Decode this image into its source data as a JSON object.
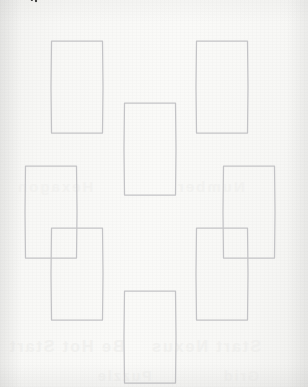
{
  "page": {
    "width": 308,
    "height": 387,
    "background_color": "#f7f7f5",
    "medium": "scanned paper"
  },
  "colors": {
    "paper": "#f7f7f5",
    "hex_stroke": "#c3c3c6",
    "arc_dots": "#2e2e2e",
    "ghost_text": "#ececea"
  },
  "arc": {
    "name": "dotted-arc",
    "style": "dotted",
    "shape": "concave-down circular arc (lower edge of a large circle)",
    "dot_color": "#2e2e2e",
    "dot_radius": 1.15,
    "dot_count": 76,
    "left_end": {
      "x": 36,
      "y": 1
    },
    "apex": {
      "x": 150,
      "y": 17
    },
    "right_end": {
      "x": 268,
      "y": 1
    },
    "label": ""
  },
  "hex_grid": {
    "name": "hexagon-honeycomb",
    "orientation": "flat-top",
    "count": 7,
    "stroke_color": "#c3c3c6",
    "stroke_width": 1.25,
    "fill": "none",
    "half_width": 26,
    "half_height": 46,
    "top_edge_half": 25.5,
    "arrangement": "2-3-2 flower cluster",
    "cells": [
      {
        "id": "hex-top-left",
        "label": "",
        "cx": 77,
        "cy": 87
      },
      {
        "id": "hex-top-right",
        "label": "",
        "cx": 222,
        "cy": 87
      },
      {
        "id": "hex-mid-left",
        "label": "",
        "cx": 51,
        "cy": 212
      },
      {
        "id": "hex-mid-center",
        "label": "",
        "cx": 150,
        "cy": 149
      },
      {
        "id": "hex-mid-right",
        "label": "",
        "cx": 249,
        "cy": 212
      },
      {
        "id": "hex-bottom-left",
        "label": "",
        "cx": 77,
        "cy": 274
      },
      {
        "id": "hex-bottom-right",
        "label": "",
        "cx": 222,
        "cy": 274
      },
      {
        "id": "hex-bottom-center",
        "label": "",
        "cx": 150,
        "cy": 337
      }
    ]
  },
  "ghost_marks": [
    {
      "text": "Be Hot Start",
      "x": 8,
      "y": 338,
      "size": 16,
      "opacity": 0.55
    },
    {
      "text": "Start Nexus",
      "x": 150,
      "y": 338,
      "size": 16,
      "opacity": 0.5
    },
    {
      "text": "Hexagon",
      "x": 16,
      "y": 178,
      "size": 15,
      "opacity": 0.4
    },
    {
      "text": "Number",
      "x": 176,
      "y": 178,
      "size": 15,
      "opacity": 0.4
    },
    {
      "text": "Puzzle",
      "x": 96,
      "y": 368,
      "size": 14,
      "opacity": 0.38
    },
    {
      "text": "Grid",
      "x": 222,
      "y": 368,
      "size": 14,
      "opacity": 0.38
    }
  ]
}
